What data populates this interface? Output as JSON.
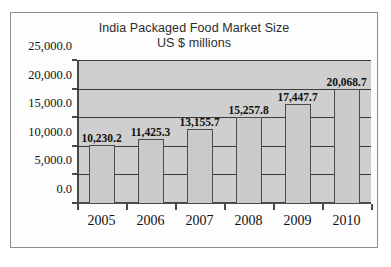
{
  "chart_data": {
    "type": "bar",
    "title": "India Packaged Food Market Size",
    "subtitle": "US $ millions",
    "xlabel": "",
    "ylabel": "",
    "categories": [
      "2005",
      "2006",
      "2007",
      "2008",
      "2009",
      "2010"
    ],
    "values": [
      10230.2,
      11425.3,
      13155.7,
      15257.8,
      17447.7,
      20068.7
    ],
    "data_labels": [
      "10,230.2",
      "11,425.3",
      "13,155.7",
      "15,257.8",
      "17,447.7",
      "20,068.7"
    ],
    "ylim": [
      0,
      25000
    ],
    "ytick_values": [
      0,
      5000,
      10000,
      15000,
      20000,
      25000
    ],
    "ytick_labels": [
      "0.0",
      "5,000.0",
      "10,000.0",
      "15,000.0",
      "20,000.0",
      "25,000.0"
    ],
    "grid": true,
    "legend": null,
    "colors": {
      "plot_background": "#cfcfcf",
      "bar_fill": "#cacaca",
      "bar_outline": "#4b4b4b",
      "gridline": "#3a3a3a",
      "axis": "#4a4a4a",
      "text": "#111111",
      "frame": "#8d8d8d",
      "page_background": "#ffffff"
    }
  }
}
